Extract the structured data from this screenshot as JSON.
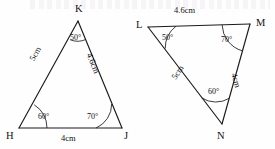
{
  "figure": {
    "stroke_color": "#1a1a1a",
    "background_color": "#fefefe",
    "width": 275,
    "height": 149
  },
  "triangles": [
    {
      "id": "triangle-hjk",
      "name": "HJK",
      "vertices": [
        {
          "name": "K",
          "label": "K",
          "x": 78,
          "y": 21,
          "label_x": 75,
          "label_y": 4
        },
        {
          "name": "H",
          "label": "H",
          "x": 19,
          "y": 128,
          "label_x": 6,
          "label_y": 132
        },
        {
          "name": "J",
          "label": "J",
          "x": 122,
          "y": 128,
          "label_x": 124,
          "label_y": 132
        }
      ],
      "sides": [
        {
          "name": "HK",
          "label": "5cm",
          "label_x": 34,
          "label_y": 62,
          "rotation": 61
        },
        {
          "name": "KJ",
          "label": "4.6cm",
          "label_x": 97,
          "label_y": 62,
          "rotation": -68
        },
        {
          "name": "HJ",
          "label": "4cm",
          "label_x": 61,
          "label_y": 138,
          "rotation": 0
        }
      ],
      "angles": [
        {
          "name": "angle-K",
          "label": "50°",
          "label_x": 72,
          "label_y": 42,
          "vertex": "K"
        },
        {
          "name": "angle-H",
          "label": "60°",
          "label_x": 38,
          "label_y": 118,
          "vertex": "H"
        },
        {
          "name": "angle-J",
          "label": "70°",
          "label_x": 88,
          "label_y": 118,
          "vertex": "J"
        }
      ]
    },
    {
      "id": "triangle-lmn",
      "name": "LMN",
      "vertices": [
        {
          "name": "L",
          "label": "L",
          "x": 148,
          "y": 27,
          "label_x": 136,
          "label_y": 22
        },
        {
          "name": "M",
          "label": "M",
          "x": 250,
          "y": 24,
          "label_x": 257,
          "label_y": 20
        },
        {
          "name": "N",
          "label": "N",
          "x": 222,
          "y": 124,
          "label_x": 218,
          "label_y": 134
        }
      ],
      "sides": [
        {
          "name": "LM",
          "label": "4.6cm",
          "label_x": 184,
          "label_y": 10,
          "rotation": 0
        },
        {
          "name": "LN",
          "label": "5cm",
          "label_x": 178,
          "label_y": 82,
          "rotation": 56
        },
        {
          "name": "MN",
          "label": "4cm",
          "label_x": 241,
          "label_y": 84,
          "rotation": -74
        }
      ],
      "angles": [
        {
          "name": "angle-L",
          "label": "50°",
          "label_x": 163,
          "label_y": 38,
          "vertex": "L"
        },
        {
          "name": "angle-M",
          "label": "70°",
          "label_x": 222,
          "label_y": 40,
          "vertex": "M"
        },
        {
          "name": "angle-N",
          "label": "60°",
          "label_x": 210,
          "label_y": 97,
          "vertex": "N"
        }
      ]
    }
  ]
}
